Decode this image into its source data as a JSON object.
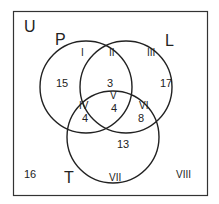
{
  "universe": {
    "label": "U",
    "outside_count": "16",
    "outside_region": "VIII"
  },
  "sets": [
    {
      "label": "P"
    },
    {
      "label": "L"
    },
    {
      "label": "T"
    }
  ],
  "regions": [
    {
      "roman": "I",
      "description": "P only",
      "value": "15"
    },
    {
      "roman": "II",
      "description": "P and L only",
      "value": "3"
    },
    {
      "roman": "III",
      "description": "L only",
      "value": "17"
    },
    {
      "roman": "IV",
      "description": "P and T only",
      "value": "4"
    },
    {
      "roman": "V",
      "description": "P, L and T",
      "value": "4"
    },
    {
      "roman": "VI",
      "description": "L and T only",
      "value": "8"
    },
    {
      "roman": "VII",
      "description": "T only",
      "value": "13"
    },
    {
      "roman": "VIII",
      "description": "outside all sets",
      "value": "16"
    }
  ],
  "colors": {
    "line": "#222222",
    "background": "#ffffff"
  }
}
